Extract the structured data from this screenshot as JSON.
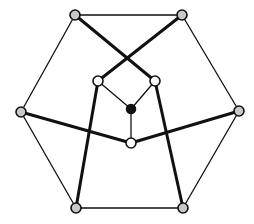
{
  "diagram": {
    "type": "graph",
    "colors": {
      "background": "#ffffff",
      "edge": "#111111",
      "outer_node_fill": "#c8c8c8",
      "inner_node_fill": "#ffffff",
      "center_node_fill": "#111111",
      "node_stroke": "#111111"
    },
    "nodes": [
      {
        "id": "top-left",
        "x": 75,
        "y": 15,
        "kind": "outer"
      },
      {
        "id": "top-right",
        "x": 182,
        "y": 15,
        "kind": "outer"
      },
      {
        "id": "left",
        "x": 21,
        "y": 112,
        "kind": "outer"
      },
      {
        "id": "right",
        "x": 239,
        "y": 111,
        "kind": "outer"
      },
      {
        "id": "bottom-left",
        "x": 76,
        "y": 208,
        "kind": "outer"
      },
      {
        "id": "bottom-right",
        "x": 183,
        "y": 208,
        "kind": "outer"
      },
      {
        "id": "inner-left",
        "x": 98,
        "y": 81,
        "kind": "inner"
      },
      {
        "id": "inner-right",
        "x": 155,
        "y": 81,
        "kind": "inner"
      },
      {
        "id": "inner-bottom",
        "x": 131,
        "y": 143,
        "kind": "inner"
      },
      {
        "id": "center",
        "x": 131,
        "y": 109,
        "kind": "center"
      }
    ],
    "edges": [
      {
        "from": "top-left",
        "to": "top-right",
        "weight": "thin"
      },
      {
        "from": "top-right",
        "to": "right",
        "weight": "thin"
      },
      {
        "from": "right",
        "to": "bottom-right",
        "weight": "thin"
      },
      {
        "from": "bottom-right",
        "to": "bottom-left",
        "weight": "thin"
      },
      {
        "from": "bottom-left",
        "to": "left",
        "weight": "thin"
      },
      {
        "from": "left",
        "to": "top-left",
        "weight": "thin"
      },
      {
        "from": "top-left",
        "to": "inner-right",
        "weight": "thick"
      },
      {
        "from": "top-right",
        "to": "inner-left",
        "weight": "thick"
      },
      {
        "from": "left",
        "to": "inner-bottom",
        "weight": "thick"
      },
      {
        "from": "right",
        "to": "inner-bottom",
        "weight": "thick"
      },
      {
        "from": "bottom-left",
        "to": "inner-left",
        "weight": "thick"
      },
      {
        "from": "bottom-right",
        "to": "inner-right",
        "weight": "thick"
      },
      {
        "from": "inner-left",
        "to": "center",
        "weight": "thin"
      },
      {
        "from": "inner-right",
        "to": "center",
        "weight": "thin"
      },
      {
        "from": "center",
        "to": "inner-bottom",
        "weight": "thin"
      }
    ]
  }
}
